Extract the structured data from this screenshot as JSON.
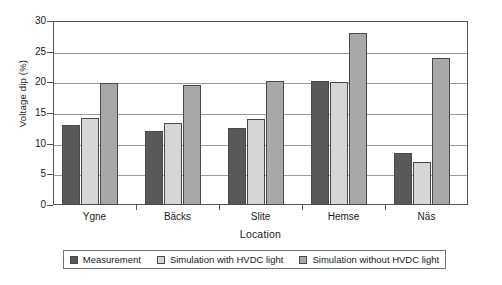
{
  "chart_data": {
    "type": "bar",
    "title": "",
    "xlabel": "Location",
    "ylabel": "Voltage dip (%)",
    "categories": [
      "Ygne",
      "Bäcks",
      "Slite",
      "Hemse",
      "Näs"
    ],
    "series": [
      {
        "name": "Measurement",
        "color": "#595959",
        "values": [
          13.0,
          12.0,
          12.6,
          20.2,
          8.5
        ]
      },
      {
        "name": "Simulation with HVDC light",
        "color": "#d6d6d6",
        "values": [
          14.2,
          13.4,
          14.0,
          20.0,
          7.0
        ]
      },
      {
        "name": "Simulation without HVDC light",
        "color": "#a8a8a8",
        "values": [
          19.9,
          19.6,
          20.3,
          28.0,
          24.0
        ]
      }
    ],
    "ylim": [
      0,
      30
    ],
    "yticks": [
      0,
      5,
      10,
      15,
      20,
      25,
      30
    ],
    "ytick_labels": [
      "0",
      "5",
      "10",
      "15",
      "20",
      "25",
      "30"
    ],
    "grid": true,
    "legend_position": "bottom"
  }
}
